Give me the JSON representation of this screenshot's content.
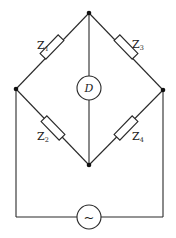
{
  "diagram": {
    "type": "AC bridge circuit",
    "components": {
      "z1": {
        "label": "Z",
        "subscript": "1"
      },
      "z2": {
        "label": "Z",
        "subscript": "2"
      },
      "z3": {
        "label": "Z",
        "subscript": "3"
      },
      "z4": {
        "label": "Z",
        "subscript": "4"
      },
      "detector": {
        "label": "D"
      },
      "source": {
        "symbol": "~"
      }
    },
    "colors": {
      "stroke": "#2a2a2a",
      "background": "#ffffff"
    }
  }
}
